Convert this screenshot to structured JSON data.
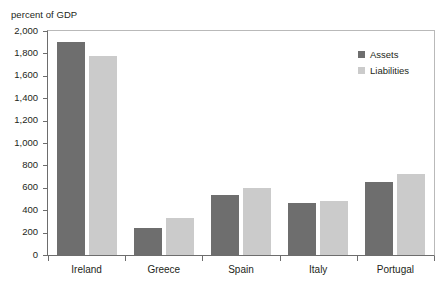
{
  "chart_data": {
    "type": "bar",
    "title": "",
    "subtitle": "",
    "xlabel": "",
    "ylabel": "percent of GDP",
    "ylim": [
      0,
      2000
    ],
    "grid": false,
    "legend_position": "top-right",
    "categories": [
      "Ireland",
      "Greece",
      "Spain",
      "Italy",
      "Portugal"
    ],
    "ytick_labels": [
      "0",
      "200",
      "400",
      "600",
      "800",
      "1,000",
      "1,200",
      "1,400",
      "1,600",
      "1,800",
      "2,000"
    ],
    "ytick_values": [
      0,
      200,
      400,
      600,
      800,
      1000,
      1200,
      1400,
      1600,
      1800,
      2000
    ],
    "series": [
      {
        "name": "Assets",
        "color": "#6e6e6e",
        "values": [
          1900,
          240,
          535,
          460,
          655
        ]
      },
      {
        "name": "Liabilities",
        "color": "#cbcbcb",
        "values": [
          1775,
          330,
          600,
          480,
          725
        ]
      }
    ]
  },
  "axis_caption": "percent of GDP",
  "legend": {
    "items": [
      {
        "label": "Assets"
      },
      {
        "label": "Liabilities"
      }
    ]
  },
  "colors": {
    "assets": "#6e6e6e",
    "liabilities": "#cbcbcb",
    "axis": "#6d6d6d",
    "frame": "#b9b9b9",
    "text": "#231f20"
  }
}
